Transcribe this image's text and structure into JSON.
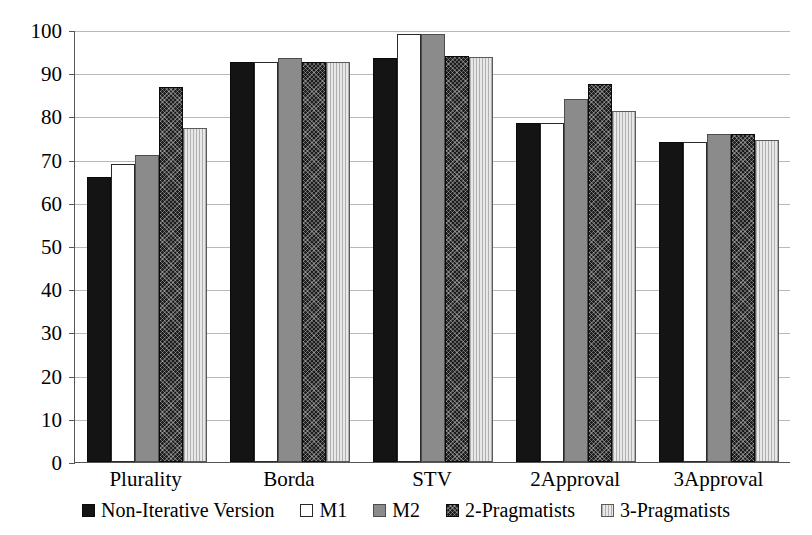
{
  "chart_data": {
    "type": "bar",
    "title": "",
    "xlabel": "",
    "ylabel": "",
    "ylim": [
      0,
      100
    ],
    "yticks": [
      0,
      10,
      20,
      30,
      40,
      50,
      60,
      70,
      80,
      90,
      100
    ],
    "grid": true,
    "legend_position": "bottom",
    "categories": [
      "Plurality",
      "Borda",
      "STV",
      "2Approval",
      "3Approval"
    ],
    "series": [
      {
        "name": "Non-Iterative Version",
        "values": [
          66,
          92.5,
          93.5,
          78.5,
          74
        ],
        "style": "solid-black",
        "color": "#141414"
      },
      {
        "name": "M1",
        "values": [
          69,
          92.5,
          99,
          78.5,
          74
        ],
        "style": "white-outline",
        "color": "#ffffff"
      },
      {
        "name": "M2",
        "values": [
          71,
          93.5,
          99,
          84,
          76
        ],
        "style": "solid-gray",
        "color": "#8b8b8b"
      },
      {
        "name": "2-Pragmatists",
        "values": [
          86.8,
          92.5,
          94,
          87.5,
          76
        ],
        "style": "dark-checker",
        "color": "#1d1d1d"
      },
      {
        "name": "3-Pragmatists",
        "values": [
          77.3,
          92.5,
          93.8,
          81.2,
          74.5
        ],
        "style": "light-vstripe",
        "color": "#d2d2d2"
      }
    ]
  },
  "axis": {
    "y_tick_labels": [
      "100",
      "90",
      "80",
      "70",
      "60",
      "50",
      "40",
      "30",
      "20",
      "10",
      "0"
    ]
  }
}
